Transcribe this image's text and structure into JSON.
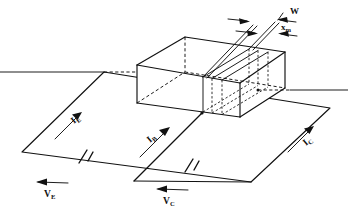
{
  "figure": {
    "background_color": "#ffffff",
    "line_color": "#111111"
  },
  "dimensions": [
    {
      "id": "w",
      "symbol": "W",
      "subscript": "",
      "x": 292,
      "y": 16,
      "description": "base width dimension at top of slab"
    },
    {
      "id": "xm",
      "symbol": "x",
      "subscript": "m",
      "x": 284,
      "y": 31,
      "description": "depletion / space-charge width dimension"
    }
  ],
  "currents": [
    {
      "id": "ie",
      "symbol": "I",
      "subscript": "E",
      "x": 74,
      "y": 120,
      "rotation": -31,
      "description": "emitter current arrow on left loop"
    },
    {
      "id": "ib",
      "symbol": "I",
      "subscript": "B",
      "x": 150,
      "y": 138,
      "rotation": -31,
      "description": "base current arrow on center lead"
    },
    {
      "id": "ic",
      "symbol": "I",
      "subscript": "C",
      "x": 306,
      "y": 142,
      "rotation": -31,
      "description": "collector current arrow on right loop"
    }
  ],
  "voltages": [
    {
      "id": "ve",
      "symbol": "V",
      "subscript": "E",
      "x": 44,
      "y": 195,
      "description": "emitter bias supply voltage, left battery"
    },
    {
      "id": "vc",
      "symbol": "V",
      "subscript": "C",
      "x": 163,
      "y": 202,
      "description": "collector bias supply voltage, center battery"
    }
  ],
  "batteries": [
    {
      "id": "battery-emitter",
      "label_ref": "ve"
    },
    {
      "id": "battery-collector",
      "label_ref": "vc"
    }
  ]
}
